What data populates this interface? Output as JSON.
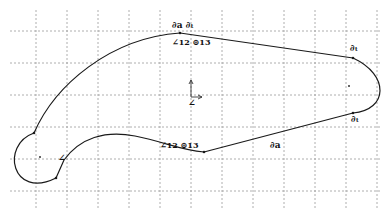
{
  "sketch": {
    "background": "#ffffff",
    "grid_color": "#9a9a9a",
    "stroke_color": "#1a1a1a",
    "grid": {
      "x": [
        36,
        67,
        98,
        129,
        160,
        191,
        222,
        253,
        284,
        315,
        346,
        377
      ],
      "y": [
        31,
        63,
        95,
        127,
        159,
        191
      ]
    },
    "relations": [
      {
        "id": "top-tangent-pair",
        "text": "∂a ∂ₜ",
        "x": 172,
        "y": 21
      },
      {
        "id": "top-angle-concentric",
        "text": "∠12 ⊚13",
        "x": 172,
        "y": 38
      },
      {
        "id": "right-top-tangent",
        "text": "∂ₜ",
        "x": 350,
        "y": 44
      },
      {
        "id": "right-bottom-tangent",
        "text": "∂ₜ",
        "x": 351,
        "y": 115
      },
      {
        "id": "bottom-line-tangent",
        "text": "∂a",
        "x": 270,
        "y": 141
      },
      {
        "id": "bottom-angle-concentric",
        "text": "∠12 ⊚13",
        "x": 160,
        "y": 141
      },
      {
        "id": "left-angle",
        "text": "∠",
        "x": 58,
        "y": 154
      }
    ],
    "origin": {
      "x": 191,
      "y": 97
    }
  }
}
